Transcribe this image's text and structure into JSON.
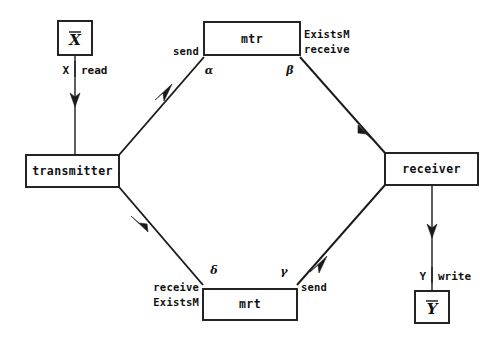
{
  "diagram": {
    "background_color": "#ffffff",
    "line_color": "#1a1a1a",
    "text_color": "#111111",
    "nodes": {
      "x_store": {
        "label": "X",
        "overbar": true
      },
      "y_store": {
        "label": "Y",
        "overbar": true
      },
      "transmitter": {
        "label": "transmitter"
      },
      "receiver": {
        "label": "receiver"
      },
      "mtr": {
        "label": "mtr"
      },
      "mrt": {
        "label": "mrt"
      }
    },
    "ports": {
      "mtr_left": "send",
      "mtr_right_line1": "ExistsM",
      "mtr_right_line2": "receive",
      "mrt_left_line1": "receive",
      "mrt_left_line2": "ExistsM",
      "mrt_right": "send"
    },
    "greek_labels": {
      "alpha": "α",
      "beta": "β",
      "gamma": "γ",
      "delta": "δ"
    },
    "io_labels": {
      "x_channel": "X",
      "x_action": "read",
      "y_channel": "Y",
      "y_action": "write"
    }
  }
}
